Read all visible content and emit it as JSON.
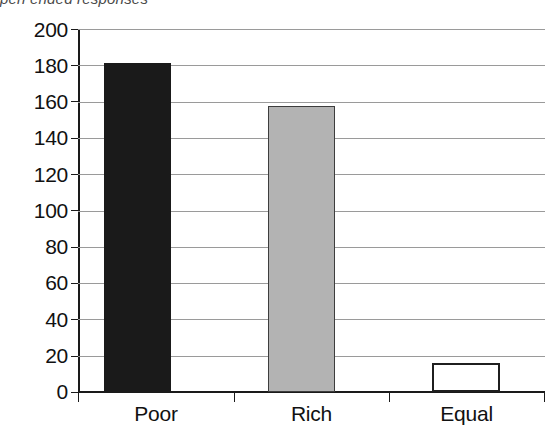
{
  "caption": {
    "text": "pen ended responses",
    "note": "clipped-top-partial-line"
  },
  "chart_data": {
    "type": "bar",
    "title": "",
    "subtitle": "",
    "xlabel": "",
    "ylabel": "",
    "categories": [
      "Poor",
      "Rich",
      "Equal"
    ],
    "values": [
      182,
      158,
      16
    ],
    "series": [
      {
        "name": "responses",
        "values": [
          182,
          158,
          16
        ]
      }
    ],
    "ylim": [
      0,
      200
    ],
    "ytick_step": 20,
    "yticks": [
      200,
      180,
      160,
      140,
      120,
      100,
      80,
      60,
      40,
      20,
      0
    ],
    "ytick_labels": [
      "200",
      "180",
      "160",
      "140",
      "120",
      "100",
      "80",
      "60",
      "40",
      "20",
      "0"
    ],
    "grid": true,
    "grid_axis": "y",
    "legend": false,
    "legend_position": "none",
    "bar_colors": [
      "#1a1a1a",
      "#b3b3b3",
      "#ffffff"
    ],
    "bar_edge_colors": [
      "#1a1a1a",
      "#3d3d3d",
      "#1f1f1f"
    ],
    "annotations": []
  },
  "axes": {
    "y_axis_name": "y-axis",
    "x_axis_name": "x-axis"
  }
}
